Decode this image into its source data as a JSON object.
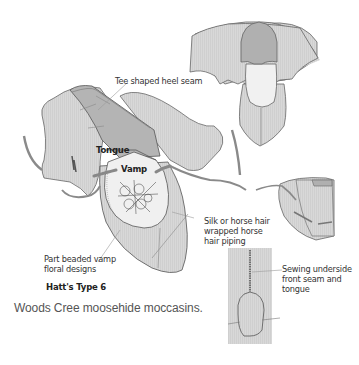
{
  "diagram": {
    "labels": {
      "heel_seam": "Tee shaped heel seam",
      "tongue": "Tongue",
      "vamp": "Vamp",
      "piping": [
        "Silk or horse hair",
        "wrapped horse",
        "hair piping"
      ],
      "beaded": [
        "Part beaded vamp",
        "floral designs"
      ],
      "type": "Hatt's Type 6",
      "sewing": [
        "Sewing underside",
        "front seam and",
        "tongue"
      ]
    },
    "caption": "Woods Cree moosehide moccasins.",
    "colors": {
      "hide": "#d6d6d6",
      "hide_dark": "#a9a9a9",
      "vamp": "#f2f2f2",
      "outline": "#555555",
      "text": "#333333"
    }
  }
}
